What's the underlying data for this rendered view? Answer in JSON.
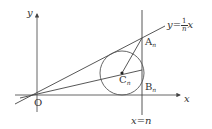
{
  "labels": {
    "y_axis": "y",
    "x_axis": "x",
    "origin": "O",
    "line_eq_prefix": "y=",
    "line_eq_num": "1",
    "line_eq_den": "n",
    "line_eq_suffix": "x",
    "point_A": "A",
    "point_A_sub": "n",
    "point_B": "B",
    "point_B_sub": "n",
    "point_C": "C",
    "point_C_sub": "n",
    "vertical_line": "x=n"
  },
  "colors": {
    "stroke": "#444444",
    "text": "#333333"
  }
}
